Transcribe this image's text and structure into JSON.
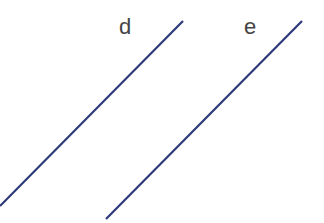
{
  "diagram": {
    "type": "parallel lines",
    "line_color": "#2e3a78",
    "lines": [
      {
        "label": "d",
        "x1": 0,
        "y1": 206,
        "x2": 183,
        "y2": 21
      },
      {
        "label": "e",
        "x1": 106,
        "y1": 219,
        "x2": 302,
        "y2": 21
      }
    ]
  }
}
